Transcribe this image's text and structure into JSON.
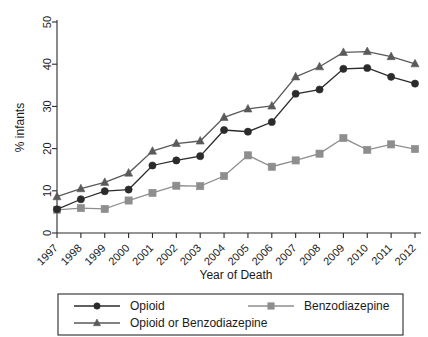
{
  "chart_data": {
    "type": "line",
    "title": "",
    "xlabel": "Year of Death",
    "ylabel": "% infants",
    "categories": [
      "1997",
      "1998",
      "1999",
      "2000",
      "2001",
      "2002",
      "2003",
      "2004",
      "2005",
      "2006",
      "2007",
      "2008",
      "2009",
      "2010",
      "2011",
      "2012"
    ],
    "x": [
      1997,
      1998,
      1999,
      2000,
      2001,
      2002,
      2003,
      2004,
      2005,
      2006,
      2007,
      2008,
      2009,
      2010,
      2011,
      2012
    ],
    "ylim": [
      0,
      50
    ],
    "yticks": [
      0,
      10,
      20,
      30,
      40,
      50
    ],
    "xlim": [
      1997,
      2012
    ],
    "grid": false,
    "legend_position": "bottom",
    "series": [
      {
        "name": "Opioid",
        "marker": "circle",
        "color": "#2b2b2b",
        "values": [
          5.6,
          8.0,
          9.9,
          10.3,
          16.0,
          17.2,
          18.2,
          24.4,
          24.0,
          26.3,
          33.0,
          34.0,
          38.9,
          39.1,
          37.0,
          35.4
        ]
      },
      {
        "name": "Benzodiazepine",
        "marker": "square",
        "color": "#8e8e8e",
        "values": [
          5.5,
          5.9,
          5.7,
          7.7,
          9.5,
          11.2,
          11.1,
          13.5,
          18.4,
          15.7,
          17.2,
          18.8,
          22.5,
          19.7,
          21.0,
          19.9
        ]
      },
      {
        "name": "Opioid or Benzodiazepine",
        "marker": "triangle",
        "color": "#5a5a5a",
        "values": [
          8.6,
          10.5,
          12.0,
          14.2,
          19.4,
          21.2,
          21.8,
          27.4,
          29.4,
          30.1,
          37.0,
          39.4,
          42.8,
          43.0,
          41.8,
          40.1
        ]
      }
    ]
  },
  "axes": {
    "y_label": "% infants",
    "x_label": "Year of Death",
    "y_tick_labels": [
      "0",
      "10",
      "20",
      "30",
      "40",
      "50"
    ],
    "x_tick_labels": [
      "1997",
      "1998",
      "1999",
      "2000",
      "2001",
      "2002",
      "2003",
      "2004",
      "2005",
      "2006",
      "2007",
      "2008",
      "2009",
      "2010",
      "2011",
      "2012"
    ]
  },
  "legend": {
    "entries": [
      {
        "label": "Opioid",
        "marker": "circle-marker",
        "color": "#2b2b2b"
      },
      {
        "label": "Benzodiazepine",
        "marker": "square-marker",
        "color": "#8e8e8e"
      },
      {
        "label": "Opioid or Benzodiazepine",
        "marker": "triangle-marker",
        "color": "#5a5a5a"
      }
    ]
  }
}
